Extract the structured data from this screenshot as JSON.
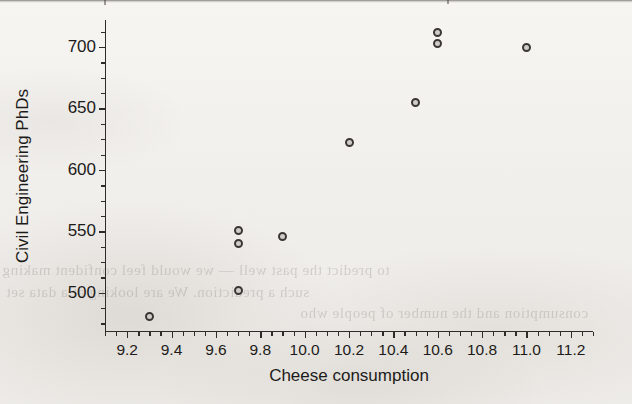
{
  "figure": {
    "kind": "scatter-plot",
    "marker_color": "#3a3734",
    "axis_color": "#2e2c29",
    "background_color": "#f2f1ee"
  },
  "bleed_through": [
    {
      "text": "to predict the past well — we would feel confident making",
      "x": 2,
      "y": 262
    },
    {
      "text": "such a prediction. We are looking at a data set",
      "x": 6,
      "y": 284
    },
    {
      "text": "consumption and the number of people who",
      "x": 300,
      "y": 305
    }
  ],
  "chart_data": {
    "type": "scatter",
    "title": "",
    "xlabel": "Cheese consumption",
    "ylabel": "Civil Engineering PhDs",
    "xlim": [
      9.1,
      11.3
    ],
    "ylim": [
      468,
      722
    ],
    "grid": false,
    "legend": null,
    "x_ticks": [
      9.2,
      9.4,
      9.6,
      9.8,
      10.0,
      10.2,
      10.4,
      10.6,
      10.8,
      11.0,
      11.2
    ],
    "x_tick_labels": [
      "9.2",
      "9.4",
      "9.6",
      "9.8",
      "10.0",
      "10.2",
      "10.4",
      "10.6",
      "10.8",
      "11.0",
      "11.2"
    ],
    "x_minor_step": 0.05,
    "y_ticks": [
      500,
      550,
      600,
      650,
      700
    ],
    "y_tick_labels": [
      "500",
      "550",
      "600",
      "650",
      "700"
    ],
    "y_minor_step": 12.5,
    "points": [
      {
        "x": 9.3,
        "y": 481
      },
      {
        "x": 9.7,
        "y": 551
      },
      {
        "x": 9.7,
        "y": 540
      },
      {
        "x": 9.7,
        "y": 502
      },
      {
        "x": 9.9,
        "y": 546
      },
      {
        "x": 10.2,
        "y": 622
      },
      {
        "x": 10.5,
        "y": 655
      },
      {
        "x": 10.6,
        "y": 712
      },
      {
        "x": 10.6,
        "y": 703
      },
      {
        "x": 11.0,
        "y": 700
      }
    ]
  }
}
